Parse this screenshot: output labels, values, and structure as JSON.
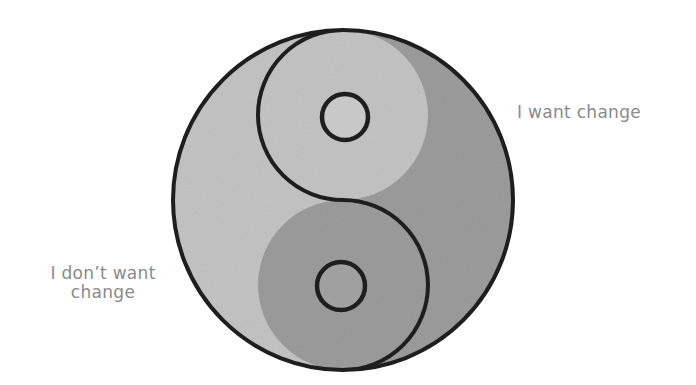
{
  "diagram": {
    "type": "yin-yang",
    "colors": {
      "dark_half": "#9c9c9c",
      "light_half": "#c4c4c4",
      "outline": "#1e1e1e",
      "label_text": "#8a8a8a",
      "background": "#ffffff"
    },
    "halves": [
      {
        "name": "upper-right",
        "label": "I want change"
      },
      {
        "name": "lower-left",
        "label_line1": "I don't want",
        "label_line2": "change"
      }
    ]
  },
  "labels": {
    "right": "I want change",
    "left_line1": "I don’t want",
    "left_line2": "change"
  }
}
